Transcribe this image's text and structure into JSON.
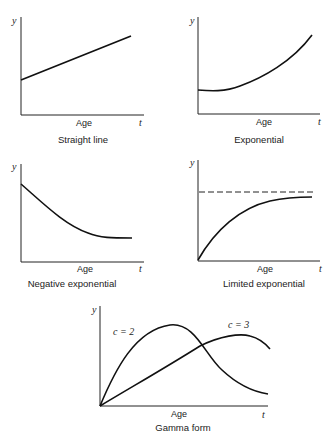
{
  "figure": {
    "axis_y_label": "y",
    "axis_x_symbol": "t",
    "axis_x_label": "Age",
    "panels": [
      {
        "caption": "Straight line",
        "curve_type": "linear"
      },
      {
        "caption": "Exponential",
        "curve_type": "exponential"
      },
      {
        "caption": "Negative exponential",
        "curve_type": "negative-exponential"
      },
      {
        "caption": "Limited exponential",
        "curve_type": "limited-exponential",
        "asymptote": "dashed"
      },
      {
        "caption": "Gamma form",
        "curve_type": "gamma",
        "series": [
          {
            "label": "c = 2"
          },
          {
            "label": "c = 3"
          }
        ]
      }
    ]
  }
}
